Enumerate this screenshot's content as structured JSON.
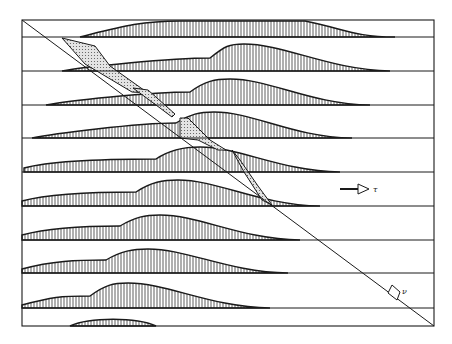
{
  "figure": {
    "frame": {
      "left": 22,
      "right": 434,
      "top": 20,
      "bottom": 326
    },
    "row_baselines": [
      37,
      71,
      105,
      138,
      172,
      206,
      240,
      273,
      308
    ],
    "diagonal": {
      "x1": 22,
      "y1": 20,
      "x2": 434,
      "y2": 326
    },
    "labels": {
      "tau": "τ",
      "nu": "ν"
    },
    "colors": {
      "ink": "#1a1a1a",
      "stipple": "#bdbdbd",
      "background": "#ffffff"
    },
    "profiles": [
      {
        "row": 0,
        "start": 80,
        "plateau_y": 20,
        "plateau_start": 180,
        "plateau_end": 305,
        "end": 395,
        "hump_x": 0,
        "hump_h": 0
      },
      {
        "row": 1,
        "start": 62,
        "base_h": 13,
        "bump_x": 210,
        "peak_x": 244,
        "peak_h": 27,
        "end": 390
      },
      {
        "row": 2,
        "start": 46,
        "base_h": 13,
        "bump_x": 190,
        "peak_x": 230,
        "peak_h": 26,
        "end": 370
      },
      {
        "row": 3,
        "start": 32,
        "base_h": 15,
        "bump_x": 176,
        "peak_x": 214,
        "peak_h": 26,
        "end": 352
      },
      {
        "row": 4,
        "start": 24,
        "base_h": 13,
        "bump_x": 156,
        "peak_x": 200,
        "peak_h": 25,
        "end": 340
      },
      {
        "row": 5,
        "start": 22,
        "base_h": 14,
        "bump_x": 136,
        "peak_x": 178,
        "peak_h": 26,
        "end": 320
      },
      {
        "row": 6,
        "start": 22,
        "base_h": 14,
        "bump_x": 120,
        "peak_x": 160,
        "peak_h": 25,
        "end": 300
      },
      {
        "row": 7,
        "start": 22,
        "base_h": 13,
        "bump_x": 106,
        "peak_x": 148,
        "peak_h": 24,
        "end": 288
      },
      {
        "row": 8,
        "start": 22,
        "base_h": 12,
        "bump_x": 90,
        "peak_x": 128,
        "peak_h": 25,
        "end": 270
      },
      {
        "row": 9,
        "start": 70,
        "base_h": 0,
        "bump_x": 70,
        "peak_x": 112,
        "peak_h": 9,
        "end": 156
      }
    ],
    "stippled_regions": [
      {
        "name": "region-1",
        "points": "85,64 62,38 95,46 110,66 148,93 132,92"
      },
      {
        "name": "region-2",
        "points": "133,88 148,90 175,114 172,117 156,105"
      },
      {
        "name": "region-3",
        "points": "180,118 188,118 210,140 226,150 218,150 198,140 180,138"
      },
      {
        "name": "region-4",
        "points": "232,150 240,160 258,186 272,205 262,200 244,172"
      }
    ],
    "arrows": {
      "tau_arrow": {
        "x1": 352,
        "y1": 189,
        "x2": 370,
        "y2": 189
      },
      "nu_arrow": {
        "x": 393,
        "y": 291
      }
    }
  }
}
